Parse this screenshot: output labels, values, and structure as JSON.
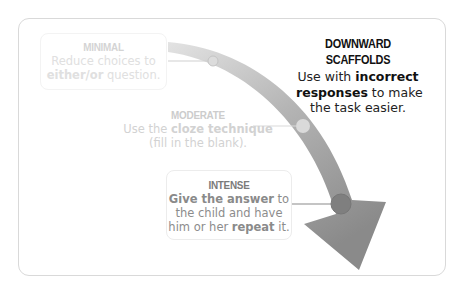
{
  "title": {
    "heading": "DOWNWARD SCAFFOLDS",
    "line1_pre": "Use with ",
    "line1_bold": "incorrect",
    "line2_bold": "responses",
    "line2_post": " to make",
    "line3": "the task easier."
  },
  "levels": {
    "minimal": {
      "heading": "MINIMAL",
      "line1": "Reduce choices to",
      "line2_bold": "either/or",
      "line2_post": " question."
    },
    "moderate": {
      "heading": "MODERATE",
      "line1_pre": "Use the ",
      "line1_bold": "cloze technique",
      "line2": "(fill in the blank)."
    },
    "intense": {
      "heading": "INTENSE",
      "line1_bold": "Give the answer",
      "line1_post": " to",
      "line2": "the child and have",
      "line3_pre": "him or her ",
      "line3_bold": "repeat",
      "line3_post": " it."
    }
  },
  "colors": {
    "arrow_start": "#e6e6e6",
    "arrow_end": "#8a8a8a",
    "frame_border": "#d9d9d9",
    "title_text": "#111111"
  },
  "icons": {
    "arrow": "curved-down-arrow-icon",
    "markers": [
      "minimal-marker-icon",
      "moderate-marker-icon",
      "intense-marker-icon"
    ]
  }
}
